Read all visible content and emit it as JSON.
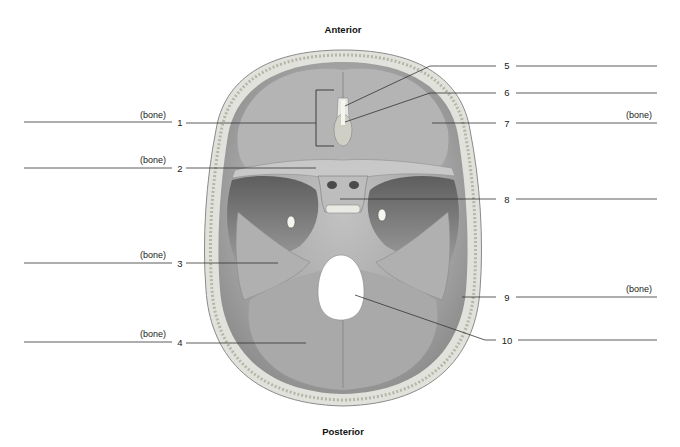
{
  "diagram": {
    "title_top": "Anterior",
    "title_bottom": "Posterior",
    "colors": {
      "bone_light": "#d8d8d8",
      "bone_mid": "#a6a6a6",
      "bone_dark": "#707070",
      "line": "#333333"
    }
  },
  "labels_left": [
    {
      "number": "1",
      "suffix": "(bone)",
      "y": 123
    },
    {
      "number": "2",
      "suffix": "(bone)",
      "y": 168
    },
    {
      "number": "3",
      "suffix": "(bone)",
      "y": 263
    },
    {
      "number": "4",
      "suffix": "(bone)",
      "y": 342
    }
  ],
  "labels_right": [
    {
      "number": "5",
      "suffix": "",
      "y": 66
    },
    {
      "number": "6",
      "suffix": "",
      "y": 93
    },
    {
      "number": "7",
      "suffix": "(bone)",
      "y": 123
    },
    {
      "number": "8",
      "suffix": "",
      "y": 199
    },
    {
      "number": "9",
      "suffix": "(bone)",
      "y": 297
    },
    {
      "number": "10",
      "suffix": "",
      "y": 340
    }
  ]
}
